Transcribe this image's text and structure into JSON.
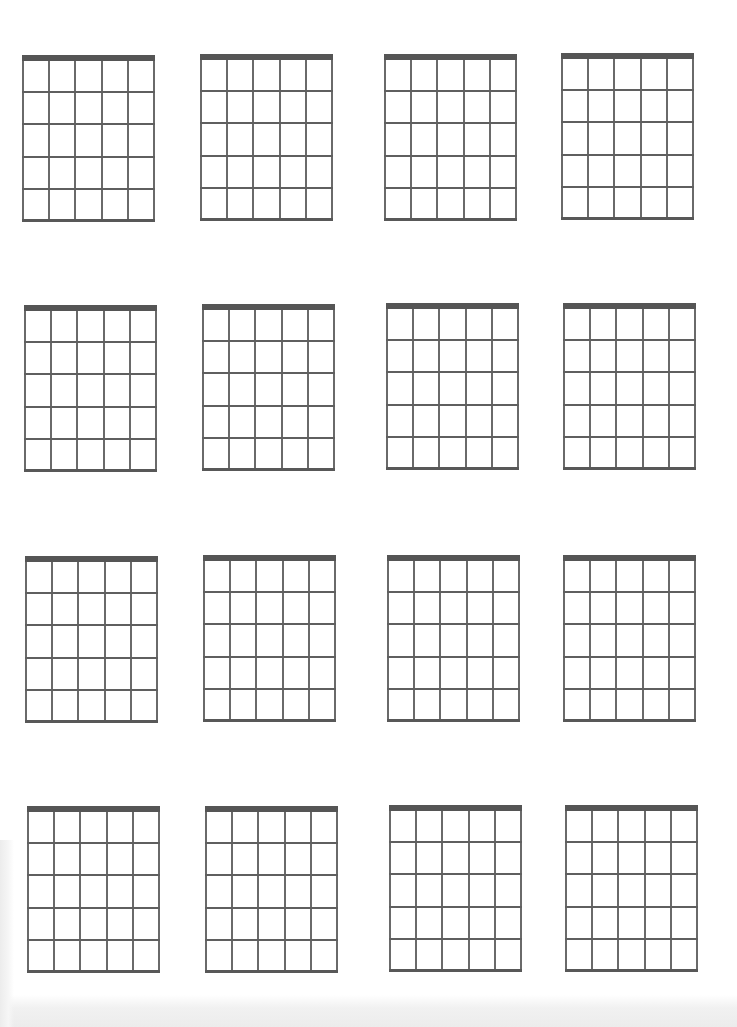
{
  "page": {
    "type": "blank guitar chord chart sheet",
    "rows": 4,
    "columns": 4,
    "diagram_count": 16
  },
  "diagram": {
    "strings": 6,
    "frets": 5,
    "has_nut": true,
    "line_color": "#6a6a6a",
    "nut_color": "#555555"
  },
  "diagrams": [
    {
      "row": 1,
      "col": 1,
      "x": 22,
      "y": 55
    },
    {
      "row": 1,
      "col": 2,
      "x": 200,
      "y": 54
    },
    {
      "row": 1,
      "col": 3,
      "x": 384,
      "y": 54
    },
    {
      "row": 1,
      "col": 4,
      "x": 561,
      "y": 53
    },
    {
      "row": 2,
      "col": 1,
      "x": 24,
      "y": 305
    },
    {
      "row": 2,
      "col": 2,
      "x": 202,
      "y": 304
    },
    {
      "row": 2,
      "col": 3,
      "x": 386,
      "y": 303
    },
    {
      "row": 2,
      "col": 4,
      "x": 563,
      "y": 303
    },
    {
      "row": 3,
      "col": 1,
      "x": 25,
      "y": 556
    },
    {
      "row": 3,
      "col": 2,
      "x": 203,
      "y": 555
    },
    {
      "row": 3,
      "col": 3,
      "x": 387,
      "y": 555
    },
    {
      "row": 3,
      "col": 4,
      "x": 563,
      "y": 555
    },
    {
      "row": 4,
      "col": 1,
      "x": 27,
      "y": 806
    },
    {
      "row": 4,
      "col": 2,
      "x": 205,
      "y": 806
    },
    {
      "row": 4,
      "col": 3,
      "x": 389,
      "y": 805
    },
    {
      "row": 4,
      "col": 4,
      "x": 565,
      "y": 805
    }
  ]
}
